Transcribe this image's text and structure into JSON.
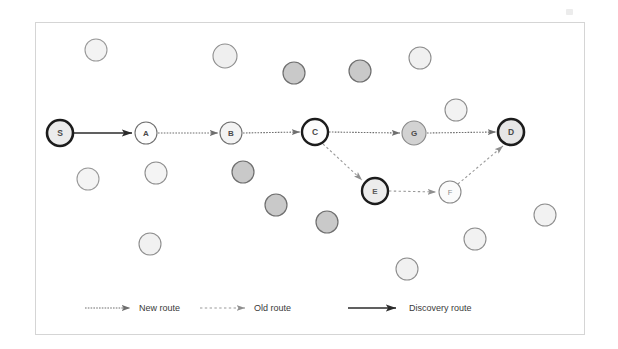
{
  "figure": {
    "frame": {
      "x": 35,
      "y": 22,
      "width": 550,
      "height": 313,
      "border_color": "#d5d5d5",
      "background": "#ffffff"
    },
    "colors": {
      "node_light_fill": "#f2f2f2",
      "node_gray_fill": "#c9c9c9",
      "node_white_fill": "#fdfdfd",
      "node_border": "#777777",
      "node_border_highlight": "#1c1c1c",
      "edge_new_route": "#6e6e6e",
      "edge_old_route": "#9a9a9a",
      "edge_discovery_route": "#2b2b2b",
      "label_text": "#4a4a4a",
      "legend_text": "#3a3a3a"
    }
  },
  "nodes": [
    {
      "id": "S",
      "label": "S",
      "x": 60,
      "y": 133,
      "r": 13,
      "fill": "#ececec",
      "stroke": "#1c1c1c",
      "stroke_width": 2.6,
      "highlighted": true
    },
    {
      "id": "A",
      "label": "A",
      "x": 146,
      "y": 133,
      "r": 11,
      "fill": "#fdfdfd",
      "stroke": "#6f6f6f",
      "stroke_width": 1.1,
      "highlighted": false
    },
    {
      "id": "B",
      "label": "B",
      "x": 231,
      "y": 133,
      "r": 11,
      "fill": "#f3f3f3",
      "stroke": "#6f6f6f",
      "stroke_width": 1.1,
      "highlighted": false
    },
    {
      "id": "C",
      "label": "C",
      "x": 315,
      "y": 132,
      "r": 13,
      "fill": "#fdfdfd",
      "stroke": "#1c1c1c",
      "stroke_width": 2.4,
      "highlighted": true
    },
    {
      "id": "G",
      "label": "G",
      "x": 414,
      "y": 133,
      "r": 12,
      "fill": "#d2d2d2",
      "stroke": "#8a8a8a",
      "stroke_width": 1.1,
      "highlighted": false
    },
    {
      "id": "D",
      "label": "D",
      "x": 511,
      "y": 132,
      "r": 13,
      "fill": "#e6e6e6",
      "stroke": "#1c1c1c",
      "stroke_width": 2.6,
      "highlighted": true
    },
    {
      "id": "E",
      "label": "E",
      "x": 375,
      "y": 191,
      "r": 13,
      "fill": "#ececec",
      "stroke": "#1c1c1c",
      "stroke_width": 2.4,
      "highlighted": true
    },
    {
      "id": "F",
      "label": "F",
      "x": 450,
      "y": 192,
      "r": 11,
      "fill": "#fbfbfb",
      "stroke": "#8a8a8a",
      "stroke_width": 1.1,
      "highlighted": false
    }
  ],
  "edges": [
    {
      "from": "S",
      "to": "A",
      "type": "discovery",
      "label": "Discovery route"
    },
    {
      "from": "A",
      "to": "B",
      "type": "new",
      "label": "New route"
    },
    {
      "from": "B",
      "to": "C",
      "type": "new",
      "label": "New route"
    },
    {
      "from": "C",
      "to": "G",
      "type": "new",
      "label": "New route"
    },
    {
      "from": "G",
      "to": "D",
      "type": "new",
      "label": "New route"
    },
    {
      "from": "C",
      "to": "E",
      "type": "old",
      "label": "Old route"
    },
    {
      "from": "E",
      "to": "F",
      "type": "old",
      "label": "Old route"
    },
    {
      "from": "F",
      "to": "D",
      "type": "old",
      "label": "Old route"
    }
  ],
  "background_nodes": [
    {
      "x": 96,
      "y": 50,
      "r": 11,
      "fill": "#f3f3f3",
      "stroke": "#9a9a9a"
    },
    {
      "x": 225,
      "y": 56,
      "r": 12,
      "fill": "#efefef",
      "stroke": "#8e8e8e"
    },
    {
      "x": 294,
      "y": 73,
      "r": 11,
      "fill": "#c9c9c9",
      "stroke": "#6f6f6f"
    },
    {
      "x": 360,
      "y": 71,
      "r": 11,
      "fill": "#c9c9c9",
      "stroke": "#6f6f6f"
    },
    {
      "x": 420,
      "y": 58,
      "r": 11,
      "fill": "#f0f0f0",
      "stroke": "#8e8e8e"
    },
    {
      "x": 456,
      "y": 110,
      "r": 11,
      "fill": "#f2f2f2",
      "stroke": "#8e8e8e"
    },
    {
      "x": 88,
      "y": 179,
      "r": 11,
      "fill": "#f4f4f4",
      "stroke": "#9a9a9a"
    },
    {
      "x": 156,
      "y": 173,
      "r": 11,
      "fill": "#f4f4f4",
      "stroke": "#8e8e8e"
    },
    {
      "x": 243,
      "y": 172,
      "r": 11,
      "fill": "#c9c9c9",
      "stroke": "#6f6f6f"
    },
    {
      "x": 276,
      "y": 205,
      "r": 11,
      "fill": "#c9c9c9",
      "stroke": "#6f6f6f"
    },
    {
      "x": 327,
      "y": 222,
      "r": 11,
      "fill": "#c9c9c9",
      "stroke": "#6f6f6f"
    },
    {
      "x": 150,
      "y": 244,
      "r": 11,
      "fill": "#f1f1f1",
      "stroke": "#8e8e8e"
    },
    {
      "x": 545,
      "y": 215,
      "r": 11,
      "fill": "#f2f2f2",
      "stroke": "#8e8e8e"
    },
    {
      "x": 475,
      "y": 239,
      "r": 11,
      "fill": "#f2f2f2",
      "stroke": "#8e8e8e"
    },
    {
      "x": 407,
      "y": 269,
      "r": 11,
      "fill": "#f1f1f1",
      "stroke": "#8e8e8e"
    }
  ],
  "legend": {
    "items": [
      {
        "key": "new",
        "label": "New route",
        "line_style": "fine-dotted-thin",
        "color": "#6e6e6e"
      },
      {
        "key": "old",
        "label": "Old route",
        "line_style": "dotted",
        "color": "#9a9a9a"
      },
      {
        "key": "discovery",
        "label": "Discovery route",
        "line_style": "solid",
        "color": "#2b2b2b"
      }
    ],
    "y": 308
  }
}
